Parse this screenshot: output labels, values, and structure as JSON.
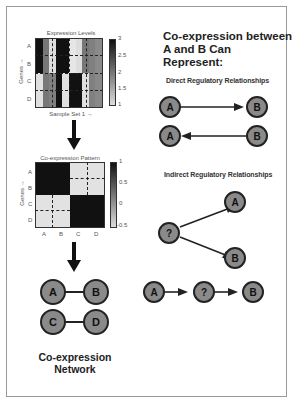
{
  "panel_left": {
    "expression_heatmap": {
      "title": "Expression Levels",
      "row_labels": [
        "A",
        "B",
        "C",
        "D"
      ],
      "y_axis_label": "Genes",
      "x_axis_label": "Sample Set 1",
      "colorbar_ticks": [
        "3",
        "2.5",
        "2",
        "1.5",
        "1"
      ],
      "columns": 10,
      "rows_AB_pattern": [
        "#111111",
        "#777777",
        "#dddddd",
        "#111111",
        "#111111",
        "#e6e6e6",
        "#dddddd",
        "#777777",
        "#808080",
        "#8a8a8a"
      ],
      "rows_CD_pattern": [
        "#e0e0e0",
        "#777777",
        "#808080",
        "#111111",
        "#e0e0e0",
        "#111111",
        "#111111",
        "#e0e0e0",
        "#808080",
        "#888888"
      ]
    },
    "coexpression_heatmap": {
      "title": "Co-expression Pattern",
      "row_labels": [
        "A",
        "B",
        "C",
        "D"
      ],
      "col_labels": [
        "A",
        "B",
        "C",
        "D"
      ],
      "y_axis_label": "Genes",
      "colorbar_ticks": [
        "1",
        "0.5",
        "0",
        "-0.5"
      ],
      "matrix": [
        [
          1,
          1,
          -0.5,
          -0.5
        ],
        [
          1,
          1,
          -0.5,
          -0.5
        ],
        [
          -0.5,
          -0.5,
          1,
          1
        ],
        [
          -0.5,
          -0.5,
          1,
          1
        ]
      ]
    },
    "network": {
      "nodes": [
        "A",
        "B",
        "C",
        "D"
      ],
      "edges": [
        [
          "A",
          "B"
        ],
        [
          "C",
          "D"
        ]
      ],
      "label_line1": "Co-expression",
      "label_line2": "Network"
    }
  },
  "panel_right": {
    "heading_line1": "Co-expression between",
    "heading_line2": "A and B Can Represent:",
    "direct": {
      "title": "Direct Regulatory Relationships",
      "row1": {
        "from": "A",
        "to": "B"
      },
      "row2": {
        "from": "B",
        "to": "A"
      }
    },
    "indirect": {
      "title": "Indirect Regulatory Relationships",
      "fork": {
        "source": "?",
        "targets": [
          "A",
          "B"
        ]
      },
      "chain": [
        "A",
        "?",
        "B"
      ]
    }
  },
  "colors": {
    "node_fill": "#8a8a8a",
    "node_stroke": "#222222",
    "frame": "#999999"
  }
}
